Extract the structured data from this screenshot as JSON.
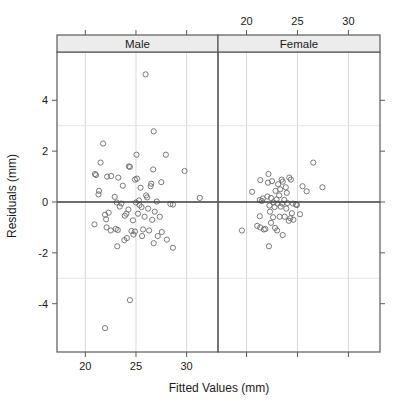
{
  "figure": {
    "type": "trellis-scatter",
    "background_color": "#ffffff",
    "marker_color": "#6b6b6b",
    "gridline_color": "#d9d9d9",
    "frame_color": "#5a5a5a",
    "strip_fill_color": "#ececec",
    "reference_line_color": "#3c3c3c"
  },
  "axes": {
    "xlabel": "Fitted Values (mm)",
    "ylabel": "Residuals (mm)",
    "x_ticks_bottom": [
      "20",
      "25",
      "30"
    ],
    "x_ticks_top": [
      "20",
      "25",
      "30"
    ],
    "y_ticks": [
      "4",
      "2",
      "0",
      "-2",
      "-4"
    ],
    "xlim": [
      17.2,
      33.1
    ],
    "ylim": [
      -5.9,
      5.9
    ],
    "grid": true,
    "reference_line_y": "0"
  },
  "panels": [
    {
      "strip_label": "Male"
    },
    {
      "strip_label": "Female"
    }
  ],
  "chart_data": {
    "type": "scatter",
    "title": "",
    "xlabel": "Fitted Values (mm)",
    "ylabel": "Residuals (mm)",
    "xlim": [
      17.2,
      33.1
    ],
    "ylim": [
      -5.9,
      5.9
    ],
    "grid": true,
    "legend": "none",
    "panel_variable": "Sex",
    "reference_line": {
      "orientation": "horizontal",
      "y": 0
    },
    "series": [
      {
        "name": "Male",
        "panel": "Male",
        "marker": "open-circle",
        "points": [
          [
            25.95,
            5.02
          ],
          [
            26.75,
            2.78
          ],
          [
            21.75,
            2.3
          ],
          [
            25.05,
            1.86
          ],
          [
            27.95,
            1.86
          ],
          [
            21.5,
            1.55
          ],
          [
            24.3,
            1.4
          ],
          [
            24.4,
            1.38
          ],
          [
            29.8,
            1.22
          ],
          [
            26.7,
            1.28
          ],
          [
            20.95,
            1.1
          ],
          [
            21.05,
            1.06
          ],
          [
            22.15,
            1.0
          ],
          [
            22.55,
            1.02
          ],
          [
            23.25,
            0.96
          ],
          [
            25.1,
            0.92
          ],
          [
            24.9,
            0.88
          ],
          [
            27.5,
            0.78
          ],
          [
            26.5,
            0.72
          ],
          [
            26.45,
            0.62
          ],
          [
            23.7,
            0.64
          ],
          [
            25.45,
            0.56
          ],
          [
            21.35,
            0.44
          ],
          [
            21.3,
            0.3
          ],
          [
            26.0,
            0.26
          ],
          [
            26.1,
            0.18
          ],
          [
            31.3,
            0.16
          ],
          [
            22.9,
            0.2
          ],
          [
            25.3,
            0.06
          ],
          [
            27.05,
            0.02
          ],
          [
            23.1,
            -0.02
          ],
          [
            23.55,
            -0.06
          ],
          [
            28.4,
            -0.08
          ],
          [
            28.65,
            -0.1
          ],
          [
            25.0,
            -0.02
          ],
          [
            25.35,
            -0.12
          ],
          [
            23.4,
            -0.18
          ],
          [
            25.55,
            -0.2
          ],
          [
            26.2,
            -0.26
          ],
          [
            24.25,
            -0.3
          ],
          [
            22.3,
            -0.42
          ],
          [
            21.95,
            -0.5
          ],
          [
            24.05,
            -0.46
          ],
          [
            25.2,
            -0.46
          ],
          [
            26.85,
            -0.38
          ],
          [
            23.9,
            -0.54
          ],
          [
            22.05,
            -0.68
          ],
          [
            27.35,
            -0.58
          ],
          [
            25.85,
            -0.58
          ],
          [
            26.6,
            -0.7
          ],
          [
            24.7,
            -0.72
          ],
          [
            20.9,
            -0.88
          ],
          [
            22.1,
            -1.0
          ],
          [
            23.0,
            -1.06
          ],
          [
            22.5,
            -1.12
          ],
          [
            23.2,
            -1.1
          ],
          [
            24.55,
            -1.14
          ],
          [
            24.9,
            -1.16
          ],
          [
            25.7,
            -1.08
          ],
          [
            26.3,
            -1.12
          ],
          [
            27.55,
            -1.18
          ],
          [
            24.75,
            -1.28
          ],
          [
            25.6,
            -1.34
          ],
          [
            27.15,
            -1.34
          ],
          [
            24.1,
            -1.42
          ],
          [
            23.85,
            -1.5
          ],
          [
            28.05,
            -1.48
          ],
          [
            26.75,
            -1.62
          ],
          [
            23.15,
            -1.74
          ],
          [
            28.65,
            -1.8
          ],
          [
            24.4,
            -3.86
          ],
          [
            21.95,
            -4.96
          ]
        ]
      },
      {
        "name": "Female",
        "panel": "Female",
        "marker": "open-circle",
        "points": [
          [
            26.55,
            1.55
          ],
          [
            22.15,
            1.1
          ],
          [
            21.35,
            0.86
          ],
          [
            22.5,
            0.82
          ],
          [
            23.45,
            0.88
          ],
          [
            23.55,
            0.8
          ],
          [
            24.2,
            0.96
          ],
          [
            24.35,
            0.88
          ],
          [
            22.1,
            0.76
          ],
          [
            23.1,
            0.7
          ],
          [
            25.5,
            0.62
          ],
          [
            23.85,
            0.58
          ],
          [
            27.45,
            0.58
          ],
          [
            23.3,
            0.5
          ],
          [
            20.55,
            0.4
          ],
          [
            22.85,
            0.44
          ],
          [
            23.95,
            0.36
          ],
          [
            25.9,
            0.42
          ],
          [
            23.2,
            0.26
          ],
          [
            22.05,
            0.22
          ],
          [
            21.6,
            0.14
          ],
          [
            22.4,
            0.16
          ],
          [
            22.95,
            0.1
          ],
          [
            21.3,
            0.08
          ],
          [
            21.5,
            0.04
          ],
          [
            23.7,
            0.08
          ],
          [
            22.65,
            -0.02
          ],
          [
            23.05,
            -0.06
          ],
          [
            23.5,
            -0.06
          ],
          [
            24.0,
            -0.04
          ],
          [
            24.55,
            -0.06
          ],
          [
            24.85,
            -0.1
          ],
          [
            24.95,
            -0.12
          ],
          [
            22.25,
            -0.14
          ],
          [
            22.75,
            -0.2
          ],
          [
            23.35,
            -0.18
          ],
          [
            23.9,
            -0.26
          ],
          [
            25.25,
            -0.48
          ],
          [
            24.45,
            -0.44
          ],
          [
            22.3,
            -0.38
          ],
          [
            21.3,
            -0.56
          ],
          [
            22.6,
            -0.6
          ],
          [
            23.25,
            -0.58
          ],
          [
            23.75,
            -0.58
          ],
          [
            24.3,
            -0.64
          ],
          [
            24.6,
            -0.7
          ],
          [
            24.15,
            -0.74
          ],
          [
            22.4,
            -0.82
          ],
          [
            21.05,
            -0.94
          ],
          [
            21.35,
            -1.0
          ],
          [
            21.7,
            -1.08
          ],
          [
            21.85,
            -1.06
          ],
          [
            22.8,
            -1.02
          ],
          [
            23.0,
            -1.12
          ],
          [
            19.55,
            -1.12
          ],
          [
            23.55,
            -1.3
          ],
          [
            22.2,
            -1.74
          ]
        ]
      }
    ]
  }
}
